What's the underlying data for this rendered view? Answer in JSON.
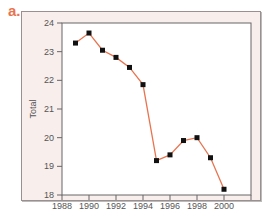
{
  "panel_label": "a.",
  "chart_data": {
    "type": "line",
    "title": "",
    "xlabel": "Year",
    "ylabel": "Total",
    "xlim": [
      1988,
      2002
    ],
    "ylim": [
      18,
      24
    ],
    "xticks": [
      1988,
      1990,
      1992,
      1994,
      1996,
      1998,
      2000
    ],
    "yticks": [
      18,
      19,
      20,
      21,
      22,
      23,
      24
    ],
    "grid": false,
    "legend": null,
    "series": [
      {
        "name": "Total",
        "color": "#e8744f",
        "marker_color": "#111111",
        "x": [
          1989,
          1990,
          1991,
          1992,
          1993,
          1994,
          1995,
          1996,
          1997,
          1998,
          1999,
          2000
        ],
        "y": [
          23.3,
          23.65,
          23.05,
          22.8,
          22.45,
          21.85,
          19.2,
          19.4,
          19.9,
          20.0,
          19.3,
          18.2
        ]
      }
    ]
  }
}
